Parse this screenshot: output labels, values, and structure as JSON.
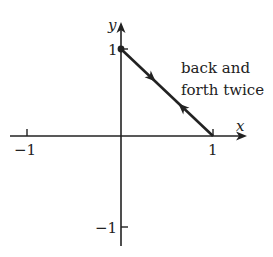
{
  "figure": {
    "axes": {
      "x_label": "x",
      "y_label": "y",
      "x_ticks": [
        {
          "value": -1,
          "label": "−1"
        },
        {
          "value": 1,
          "label": "1"
        }
      ],
      "y_ticks": [
        {
          "value": 1,
          "label": "1"
        },
        {
          "value": -1,
          "label": "−1"
        }
      ],
      "range": {
        "x": [
          -1,
          1
        ],
        "y": [
          -1,
          1
        ]
      }
    },
    "path": {
      "start_point": [
        0,
        1
      ],
      "end_point": [
        1,
        0
      ],
      "start_marker": "filled-dot",
      "direction_arrows": [
        {
          "position": "upper",
          "direction": "toward (1,0)"
        },
        {
          "position": "lower",
          "direction": "toward (0,1)"
        }
      ]
    },
    "annotation": {
      "line1": "back and",
      "line2": "forth twice"
    },
    "colors": {
      "ink": "#222222",
      "background": "#ffffff"
    }
  }
}
